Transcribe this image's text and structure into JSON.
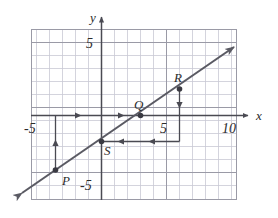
{
  "figure": {
    "type": "coordinate-plane-line-graph",
    "axes": {
      "x_axis_label": "x",
      "y_axis_label": "y",
      "x_ticks_shown": [
        "-5",
        "5",
        "10"
      ],
      "y_ticks_shown": [
        "5",
        "-5"
      ],
      "x_range": [
        -6,
        11
      ],
      "y_range": [
        -6,
        6
      ],
      "grid": true,
      "grid_color": "#c9c9d4",
      "axis_color": "#4a4a52"
    },
    "line": {
      "slope": 1,
      "y_intercept": -2,
      "equation_points": [
        [
          -3.5,
          -3.5
        ],
        [
          3,
          0
        ]
      ],
      "color": "#5a5a63",
      "arrow_both_ends": true
    },
    "points": [
      {
        "name": "P",
        "label": "P",
        "x": -3.5,
        "y": -3.5
      },
      {
        "name": "Q",
        "label": "Q",
        "x": 3,
        "y": 0
      },
      {
        "name": "R",
        "label": "R",
        "x": 7,
        "y": 2
      },
      {
        "name": "S",
        "label": "S",
        "x": 0,
        "y": -2
      }
    ],
    "construction_arrows": [
      {
        "name": "p-vertical-up",
        "from": [
          -3.5,
          -3.5
        ],
        "to": [
          -3.5,
          0
        ],
        "direction": "up"
      },
      {
        "name": "x-axis-right-1",
        "from": [
          -3.5,
          0
        ],
        "to": [
          3,
          0
        ],
        "direction": "right"
      },
      {
        "name": "r-vertical-down",
        "from": [
          7,
          2
        ],
        "to": [
          7,
          -2
        ],
        "direction": "down"
      },
      {
        "name": "s-horizontal-left",
        "from": [
          7,
          -2
        ],
        "to": [
          0,
          -2
        ],
        "direction": "left"
      }
    ],
    "tick_labels": {
      "neg_five_x": "-5",
      "five_x": "5",
      "ten_x": "10",
      "five_y": "5",
      "neg_five_y": "-5"
    }
  }
}
